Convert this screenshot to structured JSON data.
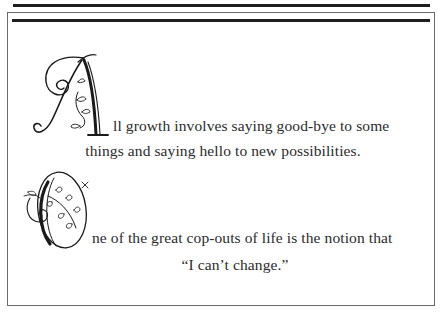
{
  "quotes": [
    {
      "drop_cap": "A",
      "line1_rest": "ll growth involves saying good-bye to some",
      "line2": "things and saying hello to new possibilities."
    },
    {
      "drop_cap": "O",
      "line1_rest": "ne of the great cop-outs of life is the notion that",
      "line2": "“I can’t change.”"
    }
  ],
  "colors": {
    "rule": "#1e1e1e",
    "frame": "#6a6a6a",
    "text": "#2b2b2b",
    "background": "#ffffff"
  }
}
